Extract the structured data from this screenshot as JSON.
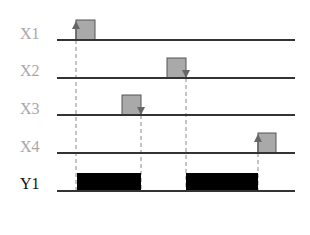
{
  "colors": {
    "input_label": "#a8a8a8",
    "output_label": "#111111",
    "baseline": "#333333",
    "pulse_fill": "#a9a9a9",
    "pulse_stroke": "#555555",
    "output_fill": "#000000",
    "dashed": "#888888",
    "arrow": "#666666"
  },
  "signals": [
    {
      "name": "X1",
      "type": "input",
      "baseline_y": 40,
      "pulse": {
        "x1": 76,
        "x2": 95
      },
      "arrow": {
        "x": 76,
        "direction": "up"
      }
    },
    {
      "name": "X2",
      "type": "input",
      "baseline_y": 78,
      "pulse": {
        "x1": 167,
        "x2": 186
      },
      "arrow": {
        "x": 186,
        "direction": "down"
      }
    },
    {
      "name": "X3",
      "type": "input",
      "baseline_y": 115,
      "pulse": {
        "x1": 122,
        "x2": 141
      },
      "arrow": {
        "x": 141,
        "direction": "down"
      }
    },
    {
      "name": "X4",
      "type": "input",
      "baseline_y": 153,
      "pulse": {
        "x1": 258,
        "x2": 276
      },
      "arrow": {
        "x": 258,
        "direction": "up"
      }
    },
    {
      "name": "Y1",
      "type": "output",
      "baseline_y": 191,
      "blocks": [
        {
          "x1": 77,
          "x2": 141
        },
        {
          "x1": 186,
          "x2": 258
        }
      ]
    }
  ],
  "dashed_lines": [
    {
      "x": 76,
      "from_y": 40,
      "to_y": 191
    },
    {
      "x": 141,
      "from_y": 115,
      "to_y": 191
    },
    {
      "x": 186,
      "from_y": 78,
      "to_y": 191
    },
    {
      "x": 258,
      "from_y": 153,
      "to_y": 191
    }
  ],
  "axis": {
    "x_start": 57,
    "x_end": 295,
    "pulse_height": 20,
    "output_height": 18
  }
}
